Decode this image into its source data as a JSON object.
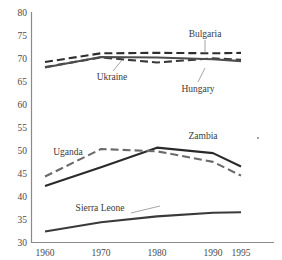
{
  "chart_data": {
    "type": "line",
    "title": "",
    "subtitle": "",
    "xlabel": "",
    "ylabel": "",
    "x": [
      1960,
      1970,
      1980,
      1990,
      1995
    ],
    "xtick_labels": [
      "1960",
      "1970",
      "1980",
      "1990",
      "1995"
    ],
    "ytick_labels": [
      "30",
      "35",
      "40",
      "45",
      "50",
      "55",
      "60",
      "65",
      "70",
      "75",
      "80"
    ],
    "yticks": [
      30,
      35,
      40,
      45,
      50,
      55,
      60,
      65,
      70,
      75,
      80
    ],
    "ylim": [
      30,
      80
    ],
    "xlim": [
      1960,
      1995
    ],
    "grid": false,
    "legend": "none",
    "annotations_style": "leader-line labels",
    "series": [
      {
        "name": "Bulgaria",
        "label": "Bulgaria",
        "style": "dashed",
        "color": "#2e2e2e",
        "values": [
          69.3,
          71.2,
          71.3,
          71.2,
          71.3
        ]
      },
      {
        "name": "Hungary",
        "label": "Hungary",
        "style": "dashed",
        "color": "#3a3a3a",
        "values": [
          68.2,
          70.3,
          69.2,
          70.1,
          69.8
        ]
      },
      {
        "name": "Ukraine",
        "label": "Ukraine",
        "style": "solid",
        "color": "#4d4d4d",
        "values": [
          68.1,
          70.4,
          70.3,
          69.9,
          69.5
        ]
      },
      {
        "name": "Zambia",
        "label": "Zambia",
        "style": "solid",
        "color": "#2a2a2a",
        "values": [
          42.2,
          46.3,
          50.6,
          49.4,
          46.5
        ]
      },
      {
        "name": "Uganda",
        "label": "Uganda",
        "style": "dashed",
        "color": "#6a6a6a",
        "values": [
          44.3,
          50.3,
          49.8,
          47.5,
          44.5
        ]
      },
      {
        "name": "Sierra Leone",
        "label": "Sierra Leone",
        "style": "solid",
        "color": "#3a3a3a",
        "values": [
          32.3,
          34.3,
          35.6,
          36.4,
          36.5
        ]
      }
    ]
  },
  "axis": {
    "y_labels": [
      "80",
      "75",
      "70",
      "65",
      "60",
      "55",
      "50",
      "45",
      "40",
      "35",
      "30"
    ],
    "x_labels": [
      "1960",
      "1970",
      "1980",
      "1990",
      "1995"
    ]
  },
  "annotations": {
    "bulgaria": "Bulgaria",
    "hungary": "Hungary",
    "ukraine": "Ukraine",
    "zambia": "Zambia",
    "uganda": "Uganda",
    "sierra_leone": "Sierra Leone"
  }
}
